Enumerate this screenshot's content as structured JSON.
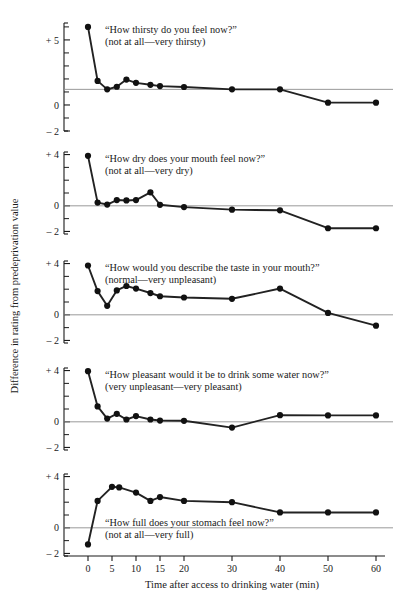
{
  "figure": {
    "ylabel": "Difference in rating from predeprivation value",
    "xlabel": "Time after access to drinking water (min)",
    "x_ticks": [
      0,
      5,
      10,
      15,
      20,
      30,
      40,
      50,
      60
    ],
    "x_tick_labels": [
      "0",
      "5",
      "10",
      "15",
      "20",
      "30",
      "40",
      "50",
      "60"
    ],
    "xlim": [
      -3,
      62
    ]
  },
  "chart_data": [
    {
      "type": "line",
      "panel": 1,
      "title": "“How thirsty do you feel now?”",
      "subtitle": "(not at all—very thirsty)",
      "xlabel": "",
      "ylabel": "Difference in rating from predeprivation value",
      "ylim": [
        -2,
        6.3
      ],
      "y_ticks": [
        -2,
        -1,
        0,
        1,
        2,
        3,
        4,
        5,
        6
      ],
      "y_tick_labels": {
        "5": "+ 5",
        "0": "0",
        "-2": "– 2"
      },
      "reference_line": 1.2,
      "grid": false,
      "legend": "none",
      "x": [
        0,
        2,
        4,
        6,
        8,
        10,
        13,
        15,
        20,
        30,
        40,
        50,
        60
      ],
      "values": [
        6.0,
        1.85,
        1.2,
        1.4,
        1.95,
        1.7,
        1.55,
        1.45,
        1.38,
        1.2,
        1.2,
        0.18,
        0.18
      ]
    },
    {
      "type": "line",
      "panel": 2,
      "title": "“How dry does your mouth feel now?”",
      "subtitle": "(not at all—very dry)",
      "xlabel": "",
      "ylabel": "Difference in rating from predeprivation value",
      "ylim": [
        -2.2,
        4.2
      ],
      "y_ticks": [
        -2,
        -1,
        0,
        1,
        2,
        3,
        4
      ],
      "y_tick_labels": {
        "4": "+ 4",
        "0": "0",
        "-2": "– 2"
      },
      "reference_line": 0,
      "grid": false,
      "legend": "none",
      "x": [
        0,
        2,
        4,
        6,
        8,
        10,
        13,
        15,
        20,
        30,
        40,
        50,
        60
      ],
      "values": [
        3.9,
        0.25,
        0.1,
        0.45,
        0.42,
        0.45,
        1.05,
        0.08,
        -0.1,
        -0.3,
        -0.35,
        -1.75,
        -1.75
      ]
    },
    {
      "type": "line",
      "panel": 3,
      "title": "“How would you describe the taste in your mouth?”",
      "subtitle": "(normal—very unpleasant)",
      "xlabel": "",
      "ylabel": "Difference in rating from predeprivation value",
      "ylim": [
        -2.2,
        4.2
      ],
      "y_ticks": [
        -2,
        -1,
        0,
        1,
        2,
        3,
        4
      ],
      "y_tick_labels": {
        "4": "+ 4",
        "0": "0",
        "-2": "– 2"
      },
      "reference_line": 0,
      "grid": false,
      "legend": "none",
      "x": [
        0,
        2,
        4,
        6,
        8,
        10,
        13,
        15,
        20,
        30,
        40,
        50,
        60
      ],
      "values": [
        3.85,
        1.85,
        0.7,
        1.9,
        2.25,
        2.05,
        1.7,
        1.45,
        1.35,
        1.25,
        2.05,
        0.15,
        -0.85
      ]
    },
    {
      "type": "line",
      "panel": 4,
      "title": "“How pleasant would it be to drink some water now?”",
      "subtitle": "(very unpleasant—very pleasant)",
      "xlabel": "",
      "ylabel": "Difference in rating from predeprivation value",
      "ylim": [
        -2.2,
        4.2
      ],
      "y_ticks": [
        -2,
        -1,
        0,
        1,
        2,
        3,
        4
      ],
      "y_tick_labels": {
        "4": "+ 4",
        "0": "0",
        "-2": "– 2"
      },
      "reference_line": 0,
      "grid": false,
      "legend": "none",
      "x": [
        0,
        2,
        4,
        6,
        8,
        10,
        13,
        15,
        20,
        30,
        40,
        50,
        60
      ],
      "values": [
        3.95,
        1.2,
        0.25,
        0.62,
        0.18,
        0.45,
        0.18,
        0.1,
        0.08,
        -0.45,
        0.52,
        0.5,
        0.5
      ]
    },
    {
      "type": "line",
      "panel": 5,
      "title": "“How full does your stomach feel now?”",
      "subtitle": "(not at all—very full)",
      "xlabel": "Time after access to drinking water (min)",
      "ylabel": "Difference in rating from predeprivation value",
      "ylim": [
        -2.2,
        4.2
      ],
      "y_ticks": [
        -2,
        -1,
        0,
        1,
        2,
        3,
        4
      ],
      "y_tick_labels": {
        "4": "+ 4",
        "0": "0",
        "-2": "– 2"
      },
      "reference_line": 0,
      "grid": false,
      "legend": "none",
      "x": [
        0,
        2,
        5,
        6.5,
        10,
        13,
        15,
        20,
        30,
        40,
        50,
        60
      ],
      "values": [
        -1.3,
        2.1,
        3.2,
        3.15,
        2.75,
        2.1,
        2.4,
        2.1,
        2.0,
        1.2,
        1.2,
        1.2
      ]
    }
  ]
}
